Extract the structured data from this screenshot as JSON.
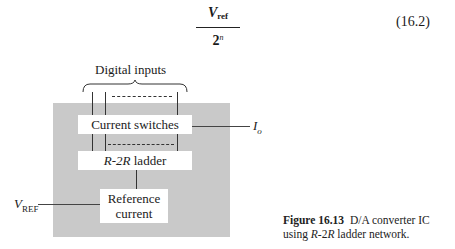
{
  "equation": {
    "numerator_main": "V",
    "numerator_sub": "ref",
    "denominator_base": "2",
    "denominator_exp": "n",
    "number": "(16.2)"
  },
  "diagram": {
    "top_label": "Digital inputs",
    "blocks": {
      "current_switches": "Current switches",
      "ladder_italic_part1": "R",
      "ladder_mid": "-2",
      "ladder_italic_part2": "R",
      "ladder_suffix": " ladder",
      "reference_line1": "Reference",
      "reference_line2": "current"
    },
    "output_label_main": "I",
    "output_label_sub": "o",
    "input_label_main": "V",
    "input_label_sub": "REF"
  },
  "caption": {
    "figure_label": "Figure 16.13",
    "text_part1": "D/A converter IC using ",
    "text_italic1": "R",
    "text_mid": "-2",
    "text_italic2": "R",
    "text_part2": " ladder network."
  }
}
